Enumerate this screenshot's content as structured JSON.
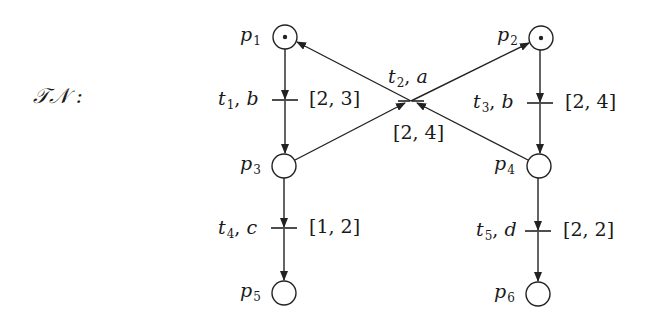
{
  "title": "𝒯𝒩 :",
  "net_name": "TN",
  "places": [
    {
      "id": "p1",
      "name": "p",
      "sub": "1",
      "tokens": 1,
      "cx": 285,
      "cy": 37
    },
    {
      "id": "p2",
      "name": "p",
      "sub": "2",
      "tokens": 1,
      "cx": 541,
      "cy": 38
    },
    {
      "id": "p3",
      "name": "p",
      "sub": "3",
      "tokens": 0,
      "cx": 284,
      "cy": 166
    },
    {
      "id": "p4",
      "name": "p",
      "sub": "4",
      "tokens": 0,
      "cx": 539,
      "cy": 166
    },
    {
      "id": "p5",
      "name": "p",
      "sub": "5",
      "tokens": 0,
      "cx": 284,
      "cy": 293
    },
    {
      "id": "p6",
      "name": "p",
      "sub": "6",
      "tokens": 0,
      "cx": 538,
      "cy": 294
    }
  ],
  "transitions": [
    {
      "id": "t1",
      "name": "t",
      "sub": "1",
      "action": "b",
      "interval": "[2, 3]"
    },
    {
      "id": "t2",
      "name": "t",
      "sub": "2",
      "action": "a",
      "interval": "[2, 4]"
    },
    {
      "id": "t3",
      "name": "t",
      "sub": "3",
      "action": "b",
      "interval": "[2, 4]"
    },
    {
      "id": "t4",
      "name": "t",
      "sub": "4",
      "action": "c",
      "interval": "[1, 2]"
    },
    {
      "id": "t5",
      "name": "t",
      "sub": "5",
      "action": "d",
      "interval": "[2, 2]"
    }
  ],
  "arcs": [
    {
      "from": "p1",
      "to": "t1"
    },
    {
      "from": "t1",
      "to": "p3"
    },
    {
      "from": "p2",
      "to": "t3"
    },
    {
      "from": "t3",
      "to": "p4"
    },
    {
      "from": "p3",
      "to": "t2"
    },
    {
      "from": "p4",
      "to": "t2"
    },
    {
      "from": "t2",
      "to": "p1"
    },
    {
      "from": "t2",
      "to": "p2"
    },
    {
      "from": "p3",
      "to": "t4"
    },
    {
      "from": "t4",
      "to": "p5"
    },
    {
      "from": "p4",
      "to": "t5"
    },
    {
      "from": "t5",
      "to": "p6"
    }
  ]
}
